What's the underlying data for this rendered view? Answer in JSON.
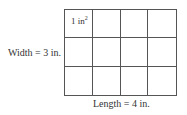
{
  "diagram": {
    "rows": 3,
    "columns": 4,
    "unit_label": "1 in",
    "unit_exponent": "2",
    "width_label": "Width = 3 in.",
    "length_label": "Length = 4 in."
  }
}
